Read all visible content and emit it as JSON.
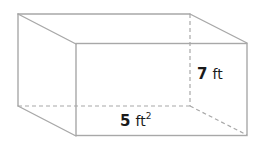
{
  "figure": {
    "shape": "rectangular-prism",
    "height_label": {
      "value": "7",
      "unit": "ft"
    },
    "base_area_label": {
      "value": "5",
      "unit": "ft",
      "exponent": "2"
    }
  },
  "colors": {
    "edge": "#a8a8a8",
    "text": "#1a1a1a",
    "background": "#ffffff"
  }
}
